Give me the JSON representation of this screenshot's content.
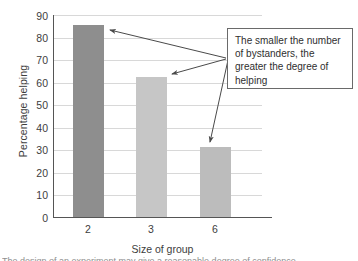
{
  "chart_data": {
    "type": "bar",
    "title": "",
    "xlabel": "Size of group",
    "ylabel": "Percentage helping",
    "categories": [
      "2",
      "3",
      "6"
    ],
    "values": [
      85.5,
      62.5,
      31
    ],
    "ylim": [
      0,
      90
    ],
    "yticks": [
      "90",
      "80",
      "70",
      "60",
      "50",
      "40",
      "30",
      "20",
      "10",
      "0"
    ],
    "grid": true,
    "legend": "none",
    "bar_colors": [
      "#8e8e8e",
      "#c6c6c6",
      "#bcbcbc"
    ],
    "annotations": [
      {
        "text": "The smaller the number of bystanders, the greater the degree of helping",
        "points_to": [
          "2",
          "3",
          "6"
        ]
      }
    ]
  },
  "annotation": {
    "line1": "The smaller the number",
    "line2": "of bystanders, the",
    "line3": "greater the degree of",
    "line4": "helping"
  },
  "axes": {
    "y_title": "Percentage helping",
    "x_title": "Size of group"
  },
  "colors": {
    "axis": "#555555",
    "grid": "#d8d8d8",
    "text": "#3d3d3d",
    "callout_border": "#6a6a6a",
    "arrow": "#4a4a4a"
  },
  "caption_sliver": "The design of an experiment may give a reasonable degree of confidence"
}
